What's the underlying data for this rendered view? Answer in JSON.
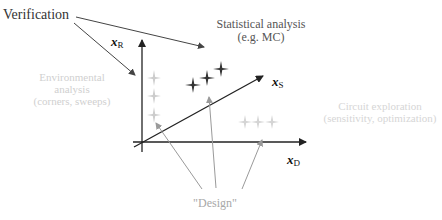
{
  "labels": {
    "verification": "Verification",
    "statistical": [
      "Statistical analysis",
      "(e.g. MC)"
    ],
    "environmental": [
      "Environmental",
      "analysis",
      "(corners, sweeps)"
    ],
    "exploration": [
      "Circuit exploration",
      "(sensitivity, optimization)"
    ],
    "design": "\"Design\""
  },
  "axes": {
    "x_R": {
      "base": "x",
      "sub": "R"
    },
    "x_S": {
      "base": "x",
      "sub": "S"
    },
    "x_D": {
      "base": "x",
      "sub": "D"
    }
  },
  "colors": {
    "dark": "#333333",
    "axis": "#222222",
    "faint_text": "#d0d0d0",
    "faint_marker": "#cccccc",
    "design_text": "#a8a8a8",
    "design_arrow": "#9a9a9a"
  }
}
